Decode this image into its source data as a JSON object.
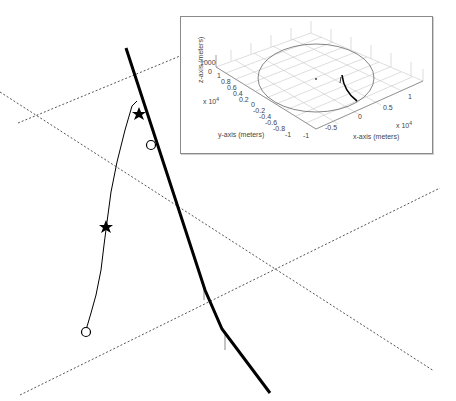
{
  "main_view": {
    "description": "3D perspective view of trajectories over ground-plane grid",
    "stroke_color": "#000000",
    "grid_color": "#555555",
    "grid_lines": [
      {
        "name": "upper-grid-line",
        "x1": 18,
        "y1": 123,
        "x2": 180,
        "y2": 56
      },
      {
        "name": "left-diagonal-grid-line",
        "x1": 0,
        "y1": 92,
        "x2": 434,
        "y2": 371
      },
      {
        "name": "middle-grid-line",
        "x1": 20,
        "y1": 395,
        "x2": 440,
        "y2": 188
      }
    ],
    "thick_trajectory": [
      [
        126,
        48
      ],
      [
        205,
        292
      ],
      [
        222,
        331
      ],
      [
        270,
        393
      ]
    ],
    "thin_trajectory": [
      [
        86,
        330
      ],
      [
        95,
        300
      ],
      [
        102,
        262
      ],
      [
        106,
        228
      ],
      [
        111,
        190
      ],
      [
        119,
        150
      ],
      [
        127,
        122
      ],
      [
        134,
        103
      ]
    ],
    "markers": [
      {
        "type": "star",
        "x": 139,
        "y": 114,
        "label": "star-marker-on-thick"
      },
      {
        "type": "star",
        "x": 106,
        "y": 227,
        "label": "star-marker-on-thin"
      },
      {
        "type": "circle",
        "x": 151,
        "y": 145,
        "label": "circle-marker-on-thick"
      },
      {
        "type": "circle",
        "x": 86,
        "y": 332,
        "label": "circle-marker-on-thin"
      }
    ],
    "tick_marks": [
      {
        "x": 204,
        "y1": 287,
        "y2": 300
      },
      {
        "x": 225,
        "y1": 335,
        "y2": 350
      }
    ]
  },
  "inset": {
    "z_axis_label": "z-axis (meters)",
    "y_axis_label": "y-axis (meters)",
    "x_axis_label": "x-axis (meters)",
    "z_ticks": [
      "1000",
      "0"
    ],
    "y_ticks": [
      "1",
      "0.8",
      "0.6",
      "0.4",
      "0.2",
      "0",
      "-0.2",
      "-0.4",
      "-0.6",
      "-0.8",
      "-1"
    ],
    "x_ticks": [
      "-1",
      "-0.5",
      "0",
      "0.5",
      "1"
    ],
    "y_exponent": "x 10",
    "y_exponent_power": "4",
    "x_exponent": "x 10",
    "x_exponent_power": "4"
  }
}
